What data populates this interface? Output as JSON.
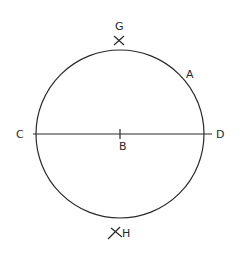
{
  "diagram": {
    "circle": {
      "cx": 120,
      "cy": 134,
      "r": 84
    },
    "diameter": {
      "x1": 35,
      "y1": 134,
      "x2": 211,
      "y2": 134
    },
    "labels": {
      "G": "G",
      "A": "A",
      "C": "C",
      "D": "D",
      "B": "B",
      "H": "H"
    },
    "marks": {
      "G_cross": {
        "x": 119,
        "y": 40
      },
      "H_cross": {
        "x": 117,
        "y": 230
      },
      "B_tick": {
        "x": 120,
        "y": 134
      }
    }
  }
}
